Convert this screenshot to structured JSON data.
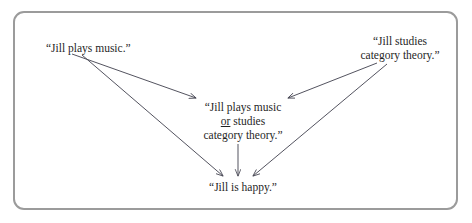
{
  "figure": {
    "background_color": "#ffffff",
    "border_color": "#9b9b9b",
    "text_color": "#1f1f1f",
    "arrow_color": "#4a4a56"
  },
  "nodes": {
    "music": {
      "id": "jill-plays-music",
      "lines": [
        "“Jill plays music.”"
      ]
    },
    "category": {
      "id": "jill-studies-category-theory",
      "lines": [
        "“Jill studies",
        "category theory.”"
      ]
    },
    "disjunction": {
      "id": "jill-plays-music-or-studies-category-theory",
      "line1": "“Jill plays music",
      "line2_underlined": "or",
      "line2_rest": " studies",
      "line3": "category theory.”"
    },
    "happy": {
      "id": "jill-is-happy",
      "lines": [
        "“Jill is happy.”"
      ]
    }
  },
  "edges": [
    {
      "id": "music-to-disjunction",
      "from": "jill-plays-music",
      "to": "jill-plays-music-or-studies-category-theory",
      "x1": 72,
      "y1": 54,
      "x2": 196,
      "y2": 98
    },
    {
      "id": "music-to-happy",
      "from": "jill-plays-music",
      "to": "jill-is-happy",
      "x1": 82,
      "y1": 55,
      "x2": 223,
      "y2": 176
    },
    {
      "id": "category-to-disjunction",
      "from": "jill-studies-category-theory",
      "to": "jill-plays-music-or-studies-category-theory",
      "x1": 377,
      "y1": 63,
      "x2": 288,
      "y2": 98
    },
    {
      "id": "category-to-happy",
      "from": "jill-studies-category-theory",
      "to": "jill-is-happy",
      "x1": 387,
      "y1": 64,
      "x2": 253,
      "y2": 176
    },
    {
      "id": "disjunction-to-happy",
      "from": "jill-plays-music-or-studies-category-theory",
      "to": "jill-is-happy",
      "x1": 238,
      "y1": 144,
      "x2": 238,
      "y2": 176
    }
  ]
}
